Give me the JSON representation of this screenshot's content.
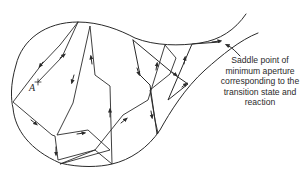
{
  "diagram": {
    "type": "potential energy surface trajectory diagram",
    "point_label": "A",
    "annotation": {
      "lines": [
        "Saddle point of",
        "minimum aperture",
        "corresponding to the",
        "transition state and",
        "reaction"
      ]
    },
    "stroke_color": "#2a2a2a",
    "background_color": "#ffffff"
  }
}
